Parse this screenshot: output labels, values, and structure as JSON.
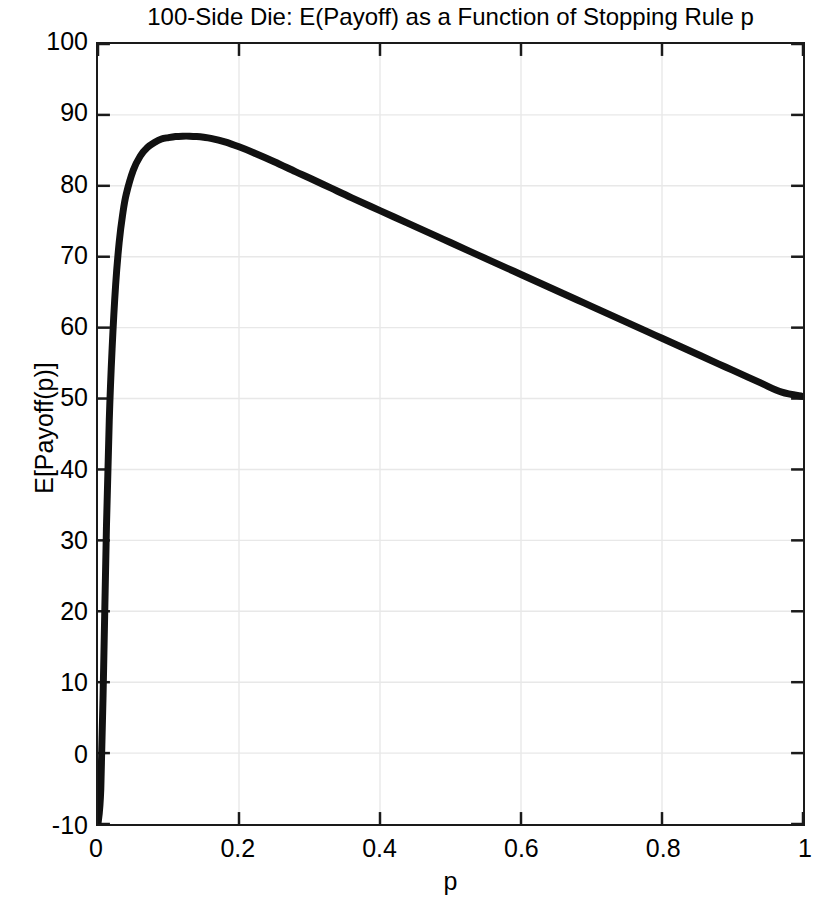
{
  "figure": {
    "background_color": "#ffffff",
    "frame_color": "#1a1a1a",
    "grid_color": "#e8e8e8",
    "line_color": "#111111"
  },
  "chart_data": {
    "type": "line",
    "title": "100-Side Die: E(Payoff) as a Function of Stopping Rule p",
    "xlabel": "p",
    "ylabel": "E[Payoff(p)]",
    "grid": true,
    "legend": null,
    "xlim": [
      0,
      1
    ],
    "ylim": [
      -10,
      100
    ],
    "xticks": [
      0,
      0.2,
      0.4,
      0.6,
      0.8,
      1
    ],
    "xticklabels": [
      "0",
      "0.2",
      "0.4",
      "0.6",
      "0.8",
      "1"
    ],
    "yticks": [
      -10,
      0,
      10,
      20,
      30,
      40,
      50,
      60,
      70,
      80,
      90,
      100
    ],
    "yticklabels": [
      "-10",
      "0",
      "10",
      "20",
      "30",
      "40",
      "50",
      "60",
      "70",
      "80",
      "90",
      "100"
    ],
    "series": [
      {
        "name": "E[Payoff(p)]",
        "x": [
          0.0,
          0.004,
          0.008,
          0.012,
          0.016,
          0.02,
          0.025,
          0.03,
          0.035,
          0.04,
          0.05,
          0.06,
          0.07,
          0.08,
          0.09,
          0.1,
          0.11,
          0.12,
          0.13,
          0.14,
          0.15,
          0.16,
          0.18,
          0.2,
          0.22,
          0.25,
          0.28,
          0.3,
          0.33,
          0.36,
          0.4,
          0.44,
          0.48,
          0.5,
          0.54,
          0.58,
          0.6,
          0.64,
          0.68,
          0.7,
          0.74,
          0.78,
          0.8,
          0.84,
          0.88,
          0.9,
          0.94,
          0.97,
          1.0
        ],
        "y": [
          -10.0,
          -5.0,
          12.0,
          32.0,
          47.0,
          57.0,
          66.0,
          72.0,
          76.0,
          78.8,
          82.2,
          84.2,
          85.4,
          86.1,
          86.6,
          86.8,
          86.95,
          87.0,
          87.0,
          86.95,
          86.85,
          86.7,
          86.2,
          85.5,
          84.7,
          83.4,
          82.0,
          81.1,
          79.7,
          78.3,
          76.5,
          74.7,
          72.9,
          72.0,
          70.2,
          68.4,
          67.5,
          65.7,
          63.9,
          63.0,
          61.2,
          59.4,
          58.5,
          56.7,
          54.9,
          54.0,
          52.2,
          50.9,
          50.3
        ],
        "peak": {
          "x": 0.13,
          "y": 87.0
        },
        "endpoints": {
          "start": {
            "x": 0.0,
            "y": -10.0
          },
          "end": {
            "x": 1.0,
            "y": 50.3
          }
        }
      }
    ]
  }
}
